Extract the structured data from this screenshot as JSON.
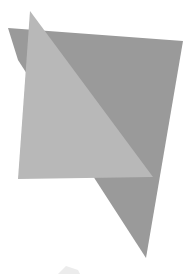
{
  "scene": {
    "width": 195,
    "height": 274,
    "background": "#ffffff",
    "shapes": [
      {
        "name": "dark-polygon",
        "fill": "#9a9a9a",
        "points": "8,28 183,41 146,258 18,60"
      },
      {
        "name": "light-triangle",
        "fill": "#b8b8b8",
        "points": "30,11 153,177 18,179"
      },
      {
        "name": "faint-smudge",
        "fill": "#ececec",
        "points": "58,274 66,266 78,270 80,274"
      }
    ]
  }
}
